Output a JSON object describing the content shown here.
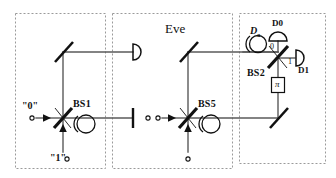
{
  "figure": {
    "type": "optical-schematic",
    "title_text": "",
    "background": "#ffffff",
    "line_color": "#555555",
    "element_color": "#111111",
    "panel_border_color": "#999999"
  },
  "panels": [
    {
      "id": "alice",
      "name": "alice-panel",
      "label": "",
      "x": 15,
      "y": 13,
      "w": 90,
      "h": 155
    },
    {
      "id": "eve",
      "name": "eve-panel",
      "label": "Eve",
      "x": 112,
      "y": 13,
      "w": 120,
      "h": 155
    },
    {
      "id": "bob",
      "name": "bob-panel",
      "label": "",
      "x": 239,
      "y": 13,
      "w": 87,
      "h": 150
    }
  ],
  "labels": {
    "eve": "Eve",
    "bs1": "BS1",
    "bs5": "BS5",
    "bs2": "BS2",
    "d0": "D0",
    "d1": "D1",
    "da": "D",
    "da_sub": "a",
    "port_0": "0",
    "port_1": "1",
    "input_0": "\"0\"",
    "input_1": "\"1\"",
    "phase_shifter": "π"
  },
  "components": [
    {
      "name": "beam-splitter-bs1",
      "kind": "beam-splitter",
      "label": "BS1",
      "x": 63,
      "y": 118
    },
    {
      "name": "beam-splitter-bs5",
      "kind": "beam-splitter",
      "label": "BS5",
      "x": 188,
      "y": 118
    },
    {
      "name": "beam-splitter-bs2",
      "kind": "beam-splitter",
      "label": "BS2",
      "x": 278,
      "y": 58
    },
    {
      "name": "mirror-alice-top",
      "kind": "mirror",
      "label": "",
      "x": 63,
      "y": 52
    },
    {
      "name": "mirror-eve-top",
      "kind": "mirror",
      "label": "",
      "x": 188,
      "y": 52
    },
    {
      "name": "mirror-bob-bottom",
      "kind": "mirror",
      "label": "",
      "x": 278,
      "y": 118
    },
    {
      "name": "detector-alice-top",
      "kind": "detector",
      "label": "",
      "x": 135,
      "y": 52
    },
    {
      "name": "detector-d0",
      "kind": "detector",
      "label": "D0",
      "x": 278,
      "y": 36
    },
    {
      "name": "detector-d1",
      "kind": "detector",
      "label": "D1",
      "x": 300,
      "y": 58
    },
    {
      "name": "delay-loop-alice",
      "kind": "delay-loop",
      "label": "",
      "x": 82,
      "y": 122
    },
    {
      "name": "delay-loop-eve",
      "kind": "delay-loop",
      "label": "",
      "x": 207,
      "y": 122
    },
    {
      "name": "delay-loop-da",
      "kind": "delay-loop",
      "label": "Da",
      "x": 258,
      "y": 46
    },
    {
      "name": "phase-shifter-pi",
      "kind": "phase-shifter",
      "label": "π",
      "x": 278,
      "y": 85
    },
    {
      "name": "beam-stop-alice",
      "kind": "beam-stop",
      "label": "",
      "x": 133,
      "y": 118
    },
    {
      "name": "input-port-0",
      "kind": "input-port",
      "label": "\"0\"",
      "x": 28,
      "y": 118
    },
    {
      "name": "input-port-1",
      "kind": "input-port",
      "label": "\"1\"",
      "x": 63,
      "y": 158
    },
    {
      "name": "input-port-eve-left",
      "kind": "input-port",
      "label": "",
      "x": 158,
      "y": 118
    },
    {
      "name": "input-port-eve-bottom",
      "kind": "input-port",
      "label": "",
      "x": 188,
      "y": 158
    }
  ]
}
